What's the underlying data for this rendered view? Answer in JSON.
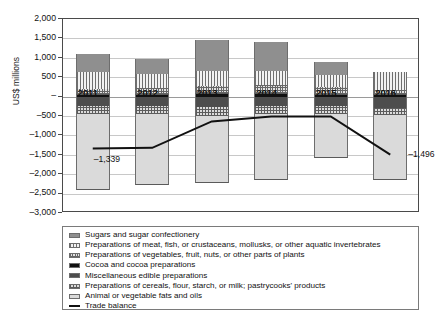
{
  "chart_data": {
    "type": "bar",
    "title": "",
    "subtitle": "",
    "xlabel": "",
    "ylabel": "US$ millions",
    "ylim": [
      -3000,
      2000
    ],
    "yticks": [
      2000,
      1500,
      1000,
      500,
      0,
      -500,
      -1000,
      -1500,
      -2000,
      -2500,
      -3000
    ],
    "ytick_labels": [
      "2,000",
      "1,500",
      "1,000",
      "500",
      "–",
      "–500",
      "–1,000",
      "–1,500",
      "–2,000",
      "–2,500",
      "–3,000"
    ],
    "grid": true,
    "stacked": true,
    "legend_position": "below",
    "categories": [
      "2011",
      "2012",
      "2013",
      "2014",
      "2015",
      "2016"
    ],
    "series": [
      {
        "name": "Sugars and sugar confectionery",
        "pattern": "solid-dark-grey",
        "values": [
          480,
          380,
          780,
          760,
          330,
          0
        ]
      },
      {
        "name": "Preparations of meat, fish, or crustaceans, mollusks, or other aquatic invertebrates",
        "pattern": "vertical-lines",
        "values": [
          430,
          350,
          390,
          360,
          300,
          460
        ]
      },
      {
        "name": "Preparations of vegetables, fruit, nuts, or other parts of plants",
        "pattern": "fine-crosshatch",
        "values": [
          140,
          160,
          190,
          200,
          180,
          120
        ]
      },
      {
        "name": "Cocoa and cocoa preparations",
        "pattern": "solid-black",
        "values": [
          60,
          70,
          90,
          90,
          70,
          60
        ]
      },
      {
        "name": "Miscellaneous edible preparations",
        "pattern": "solid-mid-grey",
        "values": [
          -230,
          -250,
          -260,
          -250,
          -250,
          -290
        ]
      },
      {
        "name": "Preparations of cereals, flour, starch, or milk; pastrycooks' products",
        "pattern": "coarse-crosshatch",
        "values": [
          -210,
          -210,
          -230,
          -200,
          -200,
          -190
        ]
      },
      {
        "name": "Animal or vegetable fats and oils",
        "pattern": "solid-light-grey",
        "values": [
          -1980,
          -1820,
          -1740,
          -1690,
          -1120,
          -1670
        ]
      }
    ],
    "line_series": {
      "name": "Trade balance",
      "values": [
        -1339,
        -1320,
        -640,
        -510,
        -510,
        -1496
      ],
      "labels": {
        "2011": "–1,339",
        "2016": "–1,496"
      }
    },
    "bar_totals_positive": [
      1110,
      960,
      1450,
      1410,
      880,
      640
    ],
    "bar_totals_negative": [
      -2420,
      -2280,
      -2230,
      -2140,
      -1570,
      -2150
    ]
  },
  "legend": {
    "items": [
      {
        "label": "Sugars and sugar confectionery",
        "swatch": "p-sugar"
      },
      {
        "label": "Preparations of meat, fish, or crustaceans, mollusks, or other aquatic invertebrates",
        "swatch": "p-meat"
      },
      {
        "label": "Preparations of vegetables, fruit, nuts, or other parts of plants",
        "swatch": "p-veg"
      },
      {
        "label": "Cocoa and cocoa preparations",
        "swatch": "p-cocoa"
      },
      {
        "label": "Miscellaneous edible preparations",
        "swatch": "p-misc"
      },
      {
        "label": "Preparations of cereals, flour, starch, or milk; pastrycooks' products",
        "swatch": "p-cereal"
      },
      {
        "label": "Animal or vegetable fats and oils",
        "swatch": "p-fats"
      },
      {
        "label": "Trade balance",
        "swatch": "p-line"
      }
    ]
  }
}
